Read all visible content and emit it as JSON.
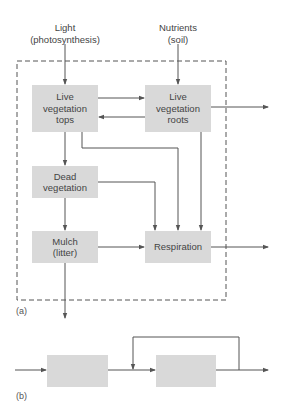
{
  "diagram_a": {
    "inputs": {
      "light": "Light\n(photosynthesis)",
      "light_line1": "Light",
      "light_line2": "(photosynthesis)",
      "nutrients_line1": "Nutrients",
      "nutrients_line2": "(soil)"
    },
    "boxes": {
      "tops": "Live vegetation tops",
      "roots": "Live vegetation roots",
      "dead": "Dead vegetation",
      "mulch": "Mulch (litter)",
      "respiration": "Respiration"
    },
    "label": "(a)"
  },
  "diagram_b": {
    "label": "(b)"
  },
  "colors": {
    "box_fill": "#d9d9d9",
    "line": "#555555"
  }
}
